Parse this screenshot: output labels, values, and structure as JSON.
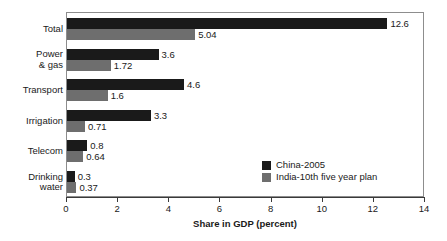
{
  "chart_data": {
    "type": "bar",
    "orientation": "horizontal",
    "title": "",
    "xlabel": "Share in GDP (percent)",
    "ylabel": "",
    "xlim": [
      0,
      14
    ],
    "xticks": [
      0,
      2,
      4,
      6,
      8,
      10,
      12,
      14
    ],
    "xtick_labels": [
      "0",
      "2",
      "4",
      "6",
      "8",
      "10",
      "12",
      "14"
    ],
    "grid": false,
    "legend_position": "inside-bottom-right",
    "categories": [
      "Total",
      "Power\n& gas",
      "Transport",
      "Irrigation",
      "Telecom",
      "Drinking\nwater"
    ],
    "series": [
      {
        "name": "China-2005",
        "color": "#1a1a1a",
        "values": [
          12.6,
          3.6,
          4.6,
          3.3,
          0.8,
          0.3
        ],
        "value_labels": [
          "12.6",
          "3.6",
          "4.6",
          "3.3",
          "0.8",
          "0.3"
        ]
      },
      {
        "name": "India-10th five year plan",
        "color": "#6e6e6e",
        "values": [
          5.04,
          1.72,
          1.6,
          0.71,
          0.64,
          0.37
        ],
        "value_labels": [
          "5.04",
          "1.72",
          "1.6",
          "0.71",
          "0.64",
          "0.37"
        ]
      }
    ]
  },
  "legend": {
    "items": [
      {
        "label": "China-2005",
        "swatch": "china"
      },
      {
        "label": "India-10th five year plan",
        "swatch": "india"
      }
    ]
  }
}
